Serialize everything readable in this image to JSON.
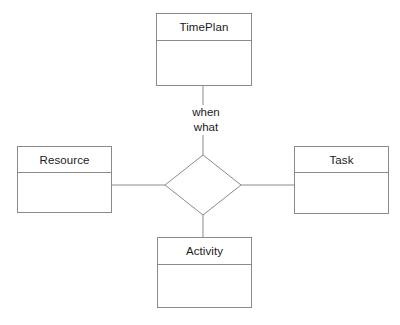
{
  "diagram": {
    "background_color": "#ffffff",
    "line_color": "#8a8a8a",
    "text_color": "#1b1b1b",
    "entities": [
      {
        "id": "timeplan",
        "name": "TimePlan",
        "position": "top",
        "body_text": ""
      },
      {
        "id": "resource",
        "name": "Resource",
        "position": "left",
        "body_text": ""
      },
      {
        "id": "task",
        "name": "Task",
        "position": "right",
        "body_text": ""
      },
      {
        "id": "activity",
        "name": "Activity",
        "position": "bottom",
        "body_text": ""
      }
    ],
    "relationship": {
      "shape": "diamond",
      "label": "",
      "center_x": 203,
      "center_y": 185,
      "half_width": 38,
      "half_height": 30
    },
    "edges": [
      {
        "from": "timeplan",
        "to": "relationship",
        "labels": [
          "when",
          "what"
        ]
      },
      {
        "from": "resource",
        "to": "relationship",
        "labels": []
      },
      {
        "from": "task",
        "to": "relationship",
        "labels": []
      },
      {
        "from": "activity",
        "to": "relationship",
        "labels": []
      }
    ],
    "edge_labels": {
      "when": "when",
      "what": "what"
    }
  }
}
